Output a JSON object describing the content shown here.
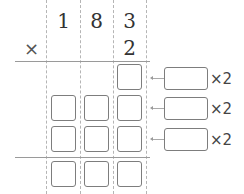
{
  "problem": {
    "multiplicand_digits": [
      "1",
      "8",
      "3"
    ],
    "multiplier_digits": [
      "",
      "",
      "2"
    ],
    "operator": "×",
    "partial_rows": [
      {
        "boxes": [
          false,
          false,
          true
        ],
        "annotation": "×2"
      },
      {
        "boxes": [
          true,
          true,
          true
        ],
        "annotation": "×2"
      },
      {
        "boxes": [
          true,
          true,
          true
        ],
        "annotation": "×2"
      }
    ],
    "result_boxes": [
      true,
      true,
      true
    ],
    "annotation_label": "×2"
  }
}
